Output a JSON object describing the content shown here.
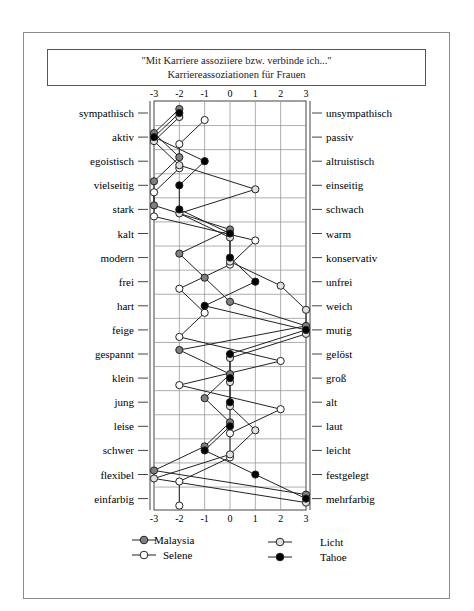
{
  "title": {
    "line1": "\"Mit Karriere assoziiere bzw. verbinde ich...\"",
    "line2": "Karriereassoziationen für Frauen"
  },
  "chart_data": {
    "type": "line",
    "orientation": "horizontal-profile",
    "title": "\"Mit Karriere assoziiere bzw. verbinde ich...\" Karriereassoziationen für Frauen",
    "xlabel": "",
    "ylabel": "",
    "xlim": [
      -3,
      3
    ],
    "x_ticks": [
      "-3",
      "-2",
      "-1",
      "0",
      "1",
      "2",
      "3"
    ],
    "grid": true,
    "legend_position": "bottom",
    "categories_left": [
      "sympathisch",
      "aktiv",
      "egoistisch",
      "vielseitig",
      "stark",
      "kalt",
      "modern",
      "frei",
      "hart",
      "feige",
      "gespannt",
      "klein",
      "jung",
      "leise",
      "schwer",
      "flexibel",
      "einfarbig"
    ],
    "categories_right": [
      "unsympathisch",
      "passiv",
      "altruistisch",
      "einseitig",
      "schwach",
      "warm",
      "konservativ",
      "unfrei",
      "weich",
      "mutig",
      "gelöst",
      "groß",
      "alt",
      "laut",
      "leicht",
      "festgelegt",
      "mehrfarbig"
    ],
    "series": [
      {
        "name": "Malaysia",
        "marker_fill": "#808080",
        "values": [
          -2,
          -3,
          -2,
          -3,
          -3,
          0,
          -2,
          -1,
          0,
          3,
          -2,
          0,
          -1,
          0,
          -1,
          -3,
          3
        ]
      },
      {
        "name": "Selene",
        "marker_fill": "#ffffff",
        "values": [
          -1,
          -2,
          -2,
          -3,
          -3,
          1,
          0,
          -2,
          -1,
          -2,
          2,
          -2,
          2,
          0,
          0,
          -2,
          -2
        ]
      },
      {
        "name": "Licht",
        "marker_fill": "#e0e0e0",
        "values": [
          -2,
          -3,
          -2,
          1,
          -2,
          0,
          0,
          2,
          3,
          3,
          0,
          0,
          0,
          1,
          0,
          -3,
          3
        ]
      },
      {
        "name": "Tahoe",
        "marker_fill": "#000000",
        "values": [
          -2,
          -3,
          -1,
          -2,
          -2,
          0,
          0,
          1,
          -1,
          3,
          0,
          0,
          0,
          0,
          -1,
          1,
          3
        ]
      }
    ]
  },
  "legend": [
    {
      "name": "Malaysia",
      "fill": "#808080"
    },
    {
      "name": "Selene",
      "fill": "#ffffff"
    },
    {
      "name": "Licht",
      "fill": "#e0e0e0"
    },
    {
      "name": "Tahoe",
      "fill": "#000000"
    }
  ]
}
